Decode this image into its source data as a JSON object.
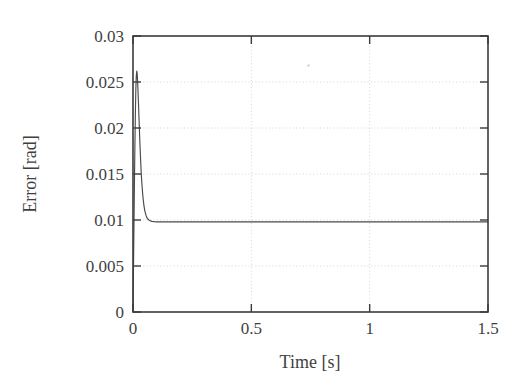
{
  "figure": {
    "background_color": "#ffffff",
    "axis_color": "#3b3b3b",
    "grid_color": "#d4d4d4",
    "curve_color": "#4a4a4a"
  },
  "chart_data": {
    "type": "line",
    "title": "",
    "xlabel": "Time [s]",
    "ylabel": "Error [rad]",
    "xlim": [
      0,
      1.5
    ],
    "ylim": [
      0,
      0.03
    ],
    "grid": true,
    "legend": "none",
    "xticks": [
      0,
      0.5,
      1,
      1.5
    ],
    "xtick_labels": [
      "0",
      "0.5",
      "1",
      "1.5"
    ],
    "yticks": [
      0,
      0.005,
      0.01,
      0.015,
      0.02,
      0.025,
      0.03
    ],
    "ytick_labels": [
      "0",
      "0.005",
      "0.01",
      "0.015",
      "0.02",
      "0.025",
      "0.03"
    ],
    "series": [
      {
        "name": "error",
        "x": [
          0.0,
          0.002,
          0.004,
          0.006,
          0.008,
          0.01,
          0.012,
          0.014,
          0.016,
          0.018,
          0.02,
          0.023,
          0.026,
          0.029,
          0.032,
          0.035,
          0.038,
          0.042,
          0.046,
          0.05,
          0.055,
          0.06,
          0.065,
          0.07,
          0.08,
          0.09,
          0.1,
          0.12,
          0.15,
          0.2,
          0.3,
          0.4,
          0.5,
          0.6,
          0.7,
          0.8,
          0.9,
          1.0,
          1.1,
          1.2,
          1.3,
          1.4,
          1.5
        ],
        "y": [
          0.0002,
          0.0047,
          0.0093,
          0.0138,
          0.018,
          0.0215,
          0.0242,
          0.0257,
          0.0262,
          0.0258,
          0.0248,
          0.0228,
          0.0206,
          0.0185,
          0.0166,
          0.015,
          0.0138,
          0.0125,
          0.0116,
          0.011,
          0.0105,
          0.0102,
          0.01005,
          0.00995,
          0.00985,
          0.00982,
          0.0098,
          0.0098,
          0.0098,
          0.0098,
          0.0098,
          0.0098,
          0.0098,
          0.0098,
          0.0098,
          0.0098,
          0.0098,
          0.0098,
          0.0098,
          0.0098,
          0.0098,
          0.0098,
          0.0098
        ],
        "peak_value": 0.0262,
        "peak_time": 0.016,
        "steady_state_value": 0.0098
      }
    ],
    "annotations": []
  }
}
